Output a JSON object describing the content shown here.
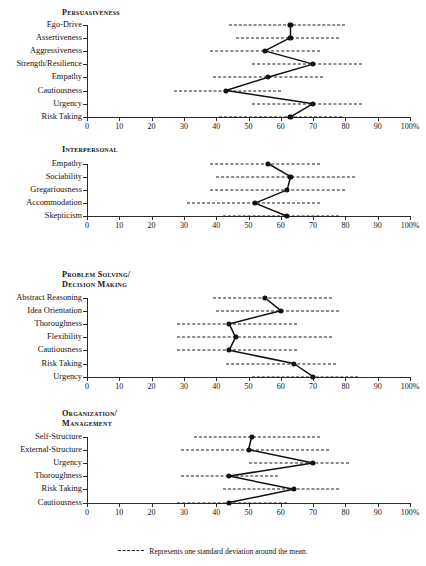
{
  "chart_data": {
    "type": "line",
    "title": "",
    "xlabel": "",
    "ylabel": "",
    "xlim": [
      0,
      100
    ],
    "grid": false,
    "legend_position": "bottom-center",
    "orientation": "horizontal",
    "axis": {
      "ticks": [
        0,
        10,
        20,
        30,
        40,
        50,
        60,
        70,
        80,
        90,
        100
      ],
      "tick_labels": [
        "0",
        "10",
        "20",
        "30",
        "40",
        "50",
        "60",
        "70",
        "80",
        "90",
        "100%"
      ]
    },
    "legend": {
      "dash_symbol": "- - - -",
      "text": "Represents one standard deviation around the mean."
    },
    "panels": [
      {
        "title": "Persuasiveness",
        "categories": [
          "Ego-Drive",
          "Assertiveness",
          "Aggressiveness",
          "Strength/Resilience",
          "Empathy",
          "Cautiousness",
          "Urgency",
          "Risk Taking"
        ],
        "values": [
          63,
          63,
          55,
          70,
          56,
          43,
          70,
          63
        ],
        "band_low": [
          44,
          46,
          38,
          51,
          39,
          27,
          51,
          41
        ],
        "band_high": [
          80,
          78,
          72,
          85,
          73,
          60,
          85,
          79
        ]
      },
      {
        "title": "Interpersonal",
        "categories": [
          "Empathy",
          "Sociability",
          "Gregariousness",
          "Accommodation",
          "Skepticism"
        ],
        "values": [
          56,
          63,
          62,
          52,
          62
        ],
        "band_low": [
          38,
          40,
          38,
          31,
          42
        ],
        "band_high": [
          72,
          83,
          80,
          72,
          78
        ]
      },
      {
        "title": "Problem Solving/\nDecision Making",
        "categories": [
          "Abstract Reasoning",
          "Idea Orientation",
          "Thoroughness",
          "Flexibility",
          "Cautiousness",
          "Risk Taking",
          "Urgency"
        ],
        "values": [
          55,
          60,
          44,
          46,
          44,
          64,
          70
        ],
        "band_low": [
          39,
          40,
          28,
          28,
          28,
          43,
          51
        ],
        "band_high": [
          76,
          78,
          65,
          76,
          65,
          77,
          84
        ]
      },
      {
        "title": "Organization/\nManagement",
        "categories": [
          "Self-Structure",
          "External-Structure",
          "Urgency",
          "Thoroughness",
          "Risk Taking",
          "Cautiousness"
        ],
        "values": [
          51,
          50,
          70,
          44,
          64,
          44
        ],
        "band_low": [
          33,
          29,
          50,
          29,
          42,
          28
        ],
        "band_high": [
          72,
          75,
          81,
          59,
          78,
          62
        ]
      }
    ]
  }
}
